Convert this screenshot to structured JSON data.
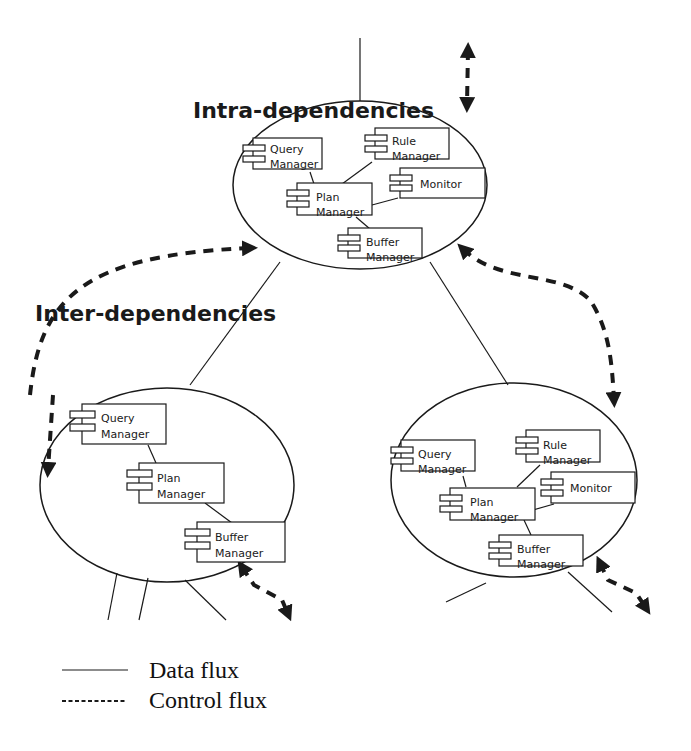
{
  "labels": {
    "intra": "Intra-dependencies",
    "inter": "Inter-dependencies"
  },
  "nodes": {
    "top": {
      "query": [
        "Query",
        "Manager"
      ],
      "rule": [
        "Rule",
        "Manager"
      ],
      "monitor": [
        "Monitor"
      ],
      "plan": [
        "Plan",
        "Manager"
      ],
      "buffer": [
        "Buffer",
        "Manager"
      ]
    },
    "left": {
      "query": [
        "Query",
        "Manager"
      ],
      "plan": [
        "Plan",
        "Manager"
      ],
      "buffer": [
        "Buffer",
        "Manager"
      ]
    },
    "right": {
      "query": [
        "Query",
        "Manager"
      ],
      "rule": [
        "Rule",
        "Manager"
      ],
      "monitor": [
        "Monitor"
      ],
      "plan": [
        "Plan",
        "Manager"
      ],
      "buffer": [
        "Buffer",
        "Manager"
      ]
    }
  },
  "legend": {
    "data": "Data flux",
    "control": "Control flux"
  },
  "colors": {
    "stroke": "#1a1a1a",
    "background": "#ffffff"
  }
}
